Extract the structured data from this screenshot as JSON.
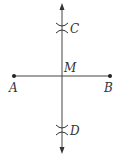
{
  "diagram": {
    "type": "perpendicular-bisector-construction",
    "colors": {
      "stroke": "#444444",
      "text": "#333333",
      "background": "#ffffff"
    },
    "segment": {
      "from": "A",
      "to": "B"
    },
    "bisector": {
      "through": [
        "C",
        "M",
        "D"
      ],
      "arrows": "both-ends"
    },
    "points": {
      "A": {
        "label": "A",
        "marker": "dot"
      },
      "B": {
        "label": "B",
        "marker": "dot"
      },
      "M": {
        "label": "M",
        "marker": "none"
      },
      "C": {
        "label": "C",
        "marker": "arc-cross"
      },
      "D": {
        "label": "D",
        "marker": "arc-cross"
      }
    }
  }
}
